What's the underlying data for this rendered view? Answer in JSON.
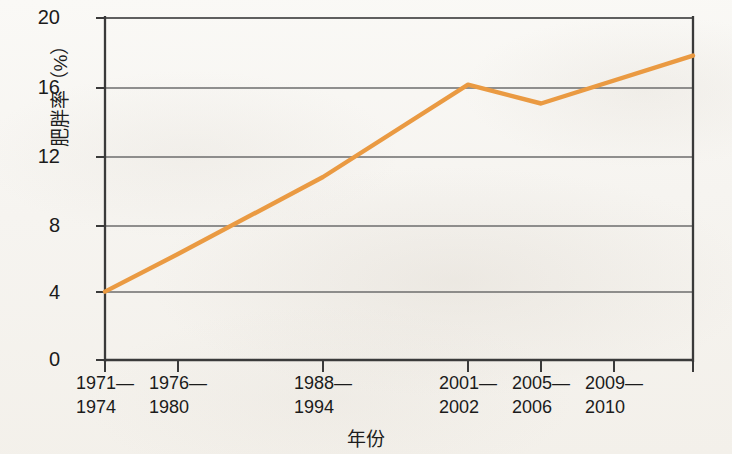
{
  "chart_data": {
    "type": "line",
    "title": "",
    "subtitle": "",
    "xlabel": "年份",
    "ylabel": "肥胖率（%）",
    "ylim": [
      0,
      20
    ],
    "yticks": [
      0,
      4,
      8,
      12,
      16,
      20
    ],
    "ytick_labels": [
      "0",
      "4",
      "8",
      "12",
      "16",
      "20"
    ],
    "grid": "horizontal",
    "legend": "none",
    "categories": [
      "1971—1974",
      "1976—1980",
      "1988—1994",
      "2001—2002",
      "2005—2006",
      "2009—2010"
    ],
    "category_lines": [
      [
        "1971—",
        "1974"
      ],
      [
        "1976—",
        "1980"
      ],
      [
        "1988—",
        "1994"
      ],
      [
        "2001—",
        "2002"
      ],
      [
        "2005—",
        "2006"
      ],
      [
        "2009—",
        "2010"
      ]
    ],
    "series": [
      {
        "name": "肥胖率",
        "color": "#ea9a42",
        "values": [
          4.0,
          6.2,
          10.7,
          16.1,
          15.0,
          17.8
        ]
      }
    ],
    "annotations": []
  },
  "style": {
    "line_color": "#ea9a42",
    "grid_color": "#6e6e6e",
    "axis_color": "#3a3a3a",
    "text_color": "#1b1b1b",
    "background": "#f7f5f1"
  }
}
